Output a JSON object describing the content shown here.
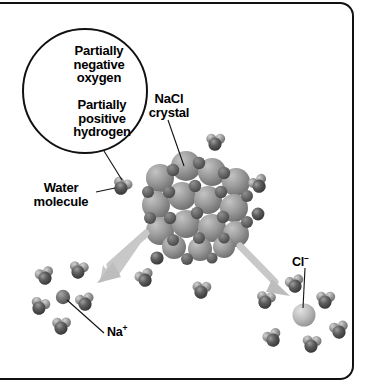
{
  "figure": {
    "background_color": "#ffffff",
    "border_color": "#111111"
  },
  "labels": {
    "partially_negative_oxygen": "Partially\nnegative\noxygen",
    "partially_positive_hydrogen": "Partially\npositive\nhydrogen",
    "nacl_crystal": "NaCl\ncrystal",
    "water_molecule": "Water\nmolecule",
    "sodium_ion": "Na",
    "sodium_ion_charge": "+",
    "chloride_ion": "Cl",
    "chloride_ion_charge": "–"
  },
  "inset": {
    "name": "magnified water molecule detail",
    "shape": "circle",
    "contains": "single water molecule with oxygen and two hydrogen atoms"
  },
  "colors": {
    "oxygen_dark": "#4a4a4a",
    "hydrogen_mid": "#8c8c8c",
    "sodium_ion": "#6e6e6e",
    "chloride_ion": "#b9b9b9",
    "crystal_sphere": "#9a9a9a",
    "arrow": "#c2c2c2",
    "leader_line": "#111111",
    "text": "#000000"
  },
  "structures": {
    "crystal": {
      "name": "NaCl crystal",
      "description": "dense cluster of spheres"
    },
    "sodium_hydration_shell": {
      "ion": "Na+",
      "water_count": 6
    },
    "chloride_hydration_shell": {
      "ion": "Cl-",
      "water_count": 6
    },
    "free_water_molecules": 3
  },
  "arrows": [
    {
      "name": "arrow-to-sodium",
      "direction": "down-left"
    },
    {
      "name": "arrow-to-chloride",
      "direction": "down-right"
    }
  ]
}
